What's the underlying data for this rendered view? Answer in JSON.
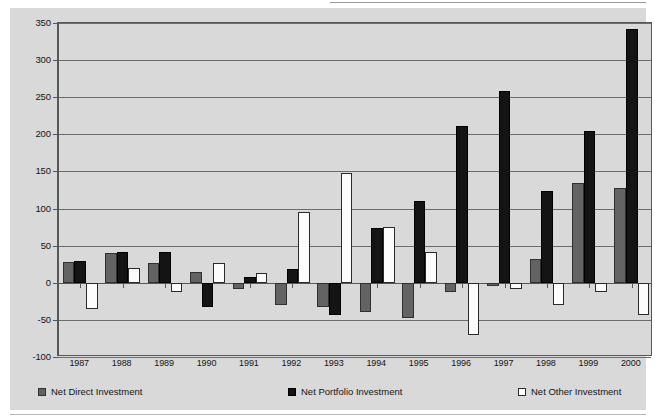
{
  "chart_data": {
    "type": "bar",
    "title": "",
    "xlabel": "",
    "ylabel": "",
    "grid": true,
    "legend_position": "bottom",
    "ylim": [
      -100,
      350
    ],
    "ytick_step": 50,
    "yticks": [
      350,
      300,
      250,
      200,
      150,
      100,
      50,
      0,
      -50,
      -100
    ],
    "ytick_labels": [
      "350",
      "300",
      "250",
      "200",
      "150",
      "100",
      "50",
      "0",
      "-50",
      "-100"
    ],
    "categories": [
      "1987",
      "1988",
      "1989",
      "1990",
      "1991",
      "1992",
      "1993",
      "1994",
      "1995",
      "1996",
      "1997",
      "1998",
      "1999",
      "2000"
    ],
    "series": [
      {
        "name": "Net Direct Investment",
        "color": "#636363",
        "swatch": "direct",
        "values": [
          28,
          40,
          27,
          15,
          -8,
          -30,
          -32,
          -40,
          -47,
          -13,
          -5,
          32,
          134,
          128
        ]
      },
      {
        "name": "Net Portfolio Investment",
        "color": "#141414",
        "swatch": "portfolio",
        "values": [
          30,
          42,
          42,
          -32,
          8,
          18,
          -43,
          74,
          110,
          211,
          258,
          124,
          205,
          342
        ]
      },
      {
        "name": "Net Other Investment",
        "color": "#ffffff",
        "swatch": "other",
        "values": [
          -35,
          20,
          -12,
          27,
          13,
          95,
          148,
          75,
          42,
          -70,
          -8,
          -30,
          -13,
          -43
        ]
      }
    ]
  },
  "legend": {
    "items": [
      {
        "label": "Net Direct Investment"
      },
      {
        "label": "Net Portfolio Investment"
      },
      {
        "label": "Net Other Investment"
      }
    ]
  }
}
